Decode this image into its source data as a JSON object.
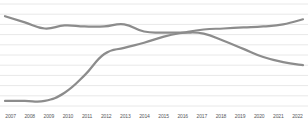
{
  "chart_data": {
    "type": "line",
    "title": "",
    "subtitle": "",
    "xlabel": "",
    "ylabel": "",
    "grid": true,
    "gridlines_count": 10,
    "legend": "none",
    "x": [
      "2007",
      "2008",
      "2009",
      "2010",
      "2011",
      "2012",
      "2013",
      "2014",
      "2015",
      "2016",
      "2017",
      "2018",
      "2019",
      "2020",
      "2021",
      "2022"
    ],
    "xlim": [
      "2007",
      "2022"
    ],
    "ylim": [
      0,
      100
    ],
    "series": [
      {
        "name": "declining-series",
        "color": "#8c8c8c",
        "values": [
          88,
          82,
          76,
          79,
          78,
          78,
          80,
          73,
          72,
          72,
          71,
          64,
          56,
          48,
          43,
          40
        ]
      },
      {
        "name": "rising-series",
        "color": "#8c8c8c",
        "values": [
          5,
          5,
          5,
          13,
          30,
          51,
          57,
          62,
          68,
          72,
          75,
          76,
          77,
          78,
          80,
          85
        ]
      }
    ]
  },
  "axis": {
    "tick_labels": [
      "2007",
      "2008",
      "2009",
      "2010",
      "2011",
      "2012",
      "2013",
      "2014",
      "2015",
      "2016",
      "2017",
      "2018",
      "2019",
      "2020",
      "2021",
      "2022"
    ]
  },
  "style": {
    "line_color": "#8c8c8c",
    "grid_color": "#e8e8e8",
    "background": "#ffffff",
    "tick_label_color": "#59595b"
  }
}
